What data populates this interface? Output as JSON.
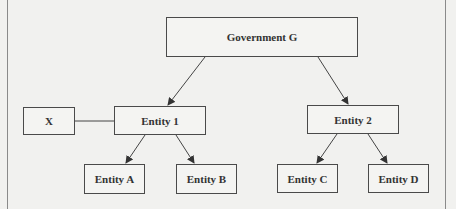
{
  "diagram": {
    "type": "organizational-structure",
    "nodes": {
      "gov": {
        "label": "Government G"
      },
      "x": {
        "label": "X"
      },
      "e1": {
        "label": "Entity 1"
      },
      "e2": {
        "label": "Entity 2"
      },
      "ea": {
        "label": "Entity A"
      },
      "eb": {
        "label": "Entity B"
      },
      "ec": {
        "label": "Entity C"
      },
      "ed": {
        "label": "Entity D"
      }
    },
    "edges": [
      {
        "from": "Government G",
        "to": "Entity 1",
        "style": "arrow"
      },
      {
        "from": "Government G",
        "to": "Entity 2",
        "style": "arrow"
      },
      {
        "from": "Entity 1",
        "to": "Entity A",
        "style": "arrow"
      },
      {
        "from": "Entity 1",
        "to": "Entity B",
        "style": "arrow"
      },
      {
        "from": "Entity 2",
        "to": "Entity C",
        "style": "arrow"
      },
      {
        "from": "Entity 2",
        "to": "Entity D",
        "style": "arrow"
      },
      {
        "from": "X",
        "to": "Entity 1",
        "style": "line"
      }
    ]
  }
}
